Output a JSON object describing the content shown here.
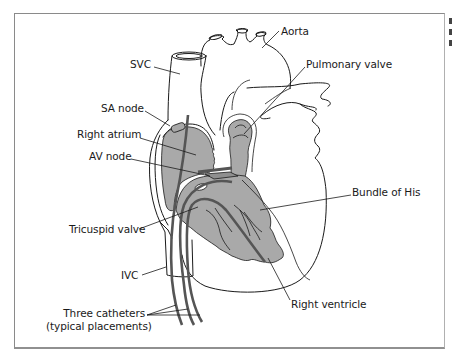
{
  "figure": {
    "colors": {
      "outline": "#1a1a1a",
      "tissue_fill": "#a9a9a9",
      "catheter": "#555555",
      "frame": "#8a8a8a",
      "background": "#ffffff"
    }
  },
  "labels": {
    "svc": "SVC",
    "sa_node": "SA node",
    "right_atrium": "Right atrium",
    "av_node": "AV node",
    "tricuspid_valve": "Tricuspid valve",
    "ivc": "IVC",
    "three_catheters_line1": "Three catheters",
    "three_catheters_line2": "(typical placements)",
    "aorta": "Aorta",
    "pulmonary_valve": "Pulmonary valve",
    "bundle_of_his": "Bundle of His",
    "right_ventricle": "Right ventricle"
  }
}
